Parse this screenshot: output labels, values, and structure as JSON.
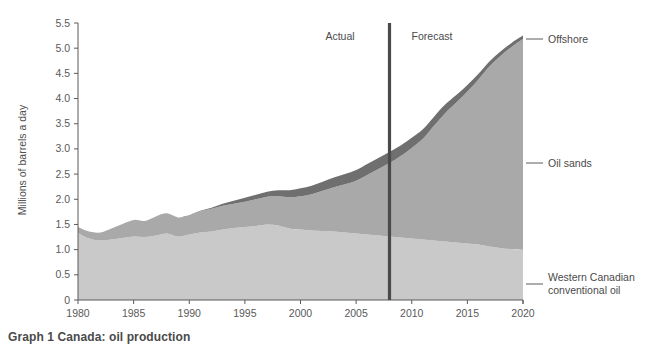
{
  "caption": "Graph 1 Canada: oil production",
  "axes": {
    "ylabel": "Millions of barrels a day",
    "yticks": [
      "0",
      "0.5",
      "1.0",
      "1.5",
      "2.0",
      "2.5",
      "3.0",
      "3.5",
      "4.0",
      "4.5",
      "5.0",
      "5.5"
    ],
    "xticks": [
      "1980",
      "1985",
      "1990",
      "1995",
      "2000",
      "2005",
      "2010",
      "2015",
      "2020"
    ]
  },
  "annotations": {
    "actual": "Actual",
    "forecast": "Forecast",
    "divider_year": 2008
  },
  "series_labels": {
    "offshore": "Offshore",
    "oil_sands": "Oil sands",
    "conventional_line1": "Western Canadian",
    "conventional_line2": "conventional oil"
  },
  "colors": {
    "offshore": "#6f6f6f",
    "oil_sands": "#a9a9a9",
    "conventional": "#c9c9c9",
    "divider": "#4a4a4a",
    "axis": "#5a5a5a",
    "text": "#4a4a4a",
    "background": "#ffffff"
  },
  "chart_data": {
    "type": "area",
    "title": "Graph 1 Canada: oil production",
    "subtitle": "",
    "xlabel": "",
    "ylabel": "Millions of barrels a day",
    "xlim": [
      1980,
      2020
    ],
    "ylim": [
      0,
      5.5
    ],
    "grid": false,
    "stacked": true,
    "legend_position": "right-outside",
    "annotations": [
      {
        "text": "Actual",
        "x": 2004,
        "y": 5.3
      },
      {
        "text": "Forecast",
        "x": 2011.5,
        "y": 5.3
      },
      {
        "text": "divider line",
        "x": 2008
      }
    ],
    "x": [
      1980,
      1981,
      1982,
      1983,
      1984,
      1985,
      1986,
      1987,
      1988,
      1989,
      1990,
      1991,
      1992,
      1993,
      1994,
      1995,
      1996,
      1997,
      1998,
      1999,
      2000,
      2001,
      2002,
      2003,
      2004,
      2005,
      2006,
      2007,
      2008,
      2009,
      2010,
      2011,
      2012,
      2013,
      2014,
      2015,
      2016,
      2017,
      2018,
      2019,
      2020
    ],
    "series": [
      {
        "name": "Western Canadian conventional oil",
        "color": "#c9c9c9",
        "values": [
          1.33,
          1.22,
          1.18,
          1.2,
          1.23,
          1.26,
          1.25,
          1.28,
          1.32,
          1.26,
          1.3,
          1.34,
          1.36,
          1.4,
          1.43,
          1.45,
          1.47,
          1.5,
          1.48,
          1.42,
          1.4,
          1.38,
          1.37,
          1.36,
          1.34,
          1.32,
          1.3,
          1.28,
          1.26,
          1.24,
          1.22,
          1.2,
          1.18,
          1.16,
          1.14,
          1.12,
          1.1,
          1.06,
          1.03,
          1.01,
          1.0
        ]
      },
      {
        "name": "Oil sands",
        "color": "#a9a9a9",
        "values": [
          0.12,
          0.14,
          0.16,
          0.22,
          0.28,
          0.33,
          0.32,
          0.38,
          0.4,
          0.38,
          0.39,
          0.42,
          0.45,
          0.47,
          0.48,
          0.5,
          0.53,
          0.55,
          0.58,
          0.62,
          0.66,
          0.72,
          0.8,
          0.88,
          0.96,
          1.05,
          1.18,
          1.32,
          1.46,
          1.62,
          1.8,
          2.0,
          2.28,
          2.55,
          2.78,
          3.02,
          3.28,
          3.58,
          3.82,
          4.02,
          4.18
        ]
      },
      {
        "name": "Offshore",
        "color": "#6f6f6f",
        "values": [
          0.0,
          0.0,
          0.0,
          0.0,
          0.0,
          0.0,
          0.0,
          0.0,
          0.0,
          0.0,
          0.0,
          0.01,
          0.02,
          0.04,
          0.06,
          0.08,
          0.09,
          0.1,
          0.12,
          0.14,
          0.16,
          0.17,
          0.18,
          0.19,
          0.2,
          0.21,
          0.22,
          0.22,
          0.22,
          0.21,
          0.2,
          0.19,
          0.18,
          0.17,
          0.15,
          0.13,
          0.11,
          0.1,
          0.09,
          0.08,
          0.07
        ]
      }
    ],
    "totals_note": "Stacked totals rise from about 1.45 in 1980 to about 5.25 in 2020"
  }
}
